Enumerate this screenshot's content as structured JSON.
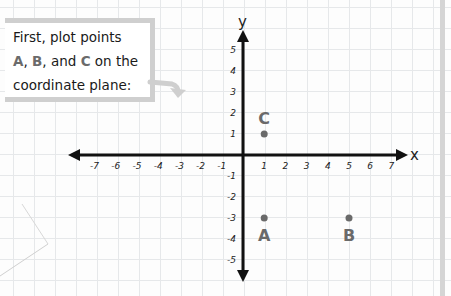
{
  "callout": {
    "line1": "First, plot points",
    "point_a": "A",
    "sep1": ", ",
    "point_b": "B",
    "sep2": ", and ",
    "point_c": "C",
    "line2_end": " on the",
    "line3": "coordinate plane:"
  },
  "axes": {
    "x_label": "x",
    "y_label": "y",
    "x_ticks": [
      "-7",
      "-6",
      "-5",
      "-4",
      "-3",
      "-2",
      "-1",
      "1",
      "2",
      "3",
      "4",
      "5",
      "6",
      "7"
    ],
    "y_ticks": [
      "5",
      "4",
      "3",
      "2",
      "1",
      "-1",
      "-2",
      "-3",
      "-4",
      "-5"
    ]
  },
  "points": [
    {
      "label": "A",
      "x": 1,
      "y": -3
    },
    {
      "label": "B",
      "x": 5,
      "y": -3
    },
    {
      "label": "C",
      "x": 1,
      "y": 1
    }
  ],
  "colors": {
    "axis": "#111111",
    "point": "#6a6a6a",
    "grid": "#e6e8ea",
    "callout_border": "#cfcfcf"
  },
  "chart_data": {
    "type": "scatter",
    "title": "",
    "xlabel": "x",
    "ylabel": "y",
    "xlim": [
      -7,
      7
    ],
    "ylim": [
      -5,
      5
    ],
    "grid": true,
    "series": [
      {
        "name": "points",
        "x": [
          1,
          5,
          1
        ],
        "y": [
          -3,
          -3,
          1
        ],
        "labels": [
          "A",
          "B",
          "C"
        ]
      }
    ]
  }
}
